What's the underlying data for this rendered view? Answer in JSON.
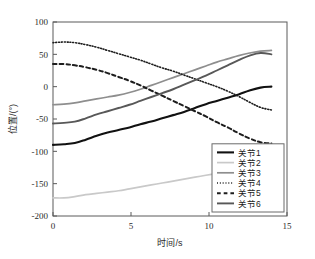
{
  "chart_data": {
    "type": "line",
    "title": "",
    "xlabel": "时间/s",
    "ylabel": "位置/(°)",
    "xlim": [
      0,
      15
    ],
    "ylim": [
      -200,
      100
    ],
    "xticks": [
      "0",
      "5",
      "10",
      "15"
    ],
    "xtick_values": [
      0,
      5,
      10,
      15
    ],
    "yticks": [
      "100",
      "50",
      "0",
      "-50",
      "-100",
      "-150",
      "-200"
    ],
    "ytick_values": [
      100,
      50,
      0,
      -50,
      -100,
      -150,
      -200
    ],
    "grid": false,
    "legend_position": "lower right",
    "x": [
      0,
      0.7,
      1.4,
      2.1,
      2.8,
      3.5,
      4.2,
      4.9,
      5.6,
      6.3,
      7.0,
      7.7,
      8.4,
      9.1,
      9.8,
      10.5,
      11.2,
      11.9,
      12.6,
      13.3,
      14.0
    ],
    "series": [
      {
        "name": "关节1",
        "label": "关节1",
        "style": "solid",
        "color": "#111111",
        "width": 2.1,
        "values": [
          -90,
          -89,
          -87,
          -82,
          -76,
          -71,
          -67,
          -63,
          -58,
          -54,
          -49,
          -44,
          -39,
          -33,
          -27,
          -22,
          -17,
          -12,
          -6,
          -1.5,
          0
        ]
      },
      {
        "name": "关节2",
        "label": "关节2",
        "style": "solid",
        "color": "#c9c9c9",
        "width": 1.7,
        "values": [
          -172,
          -172,
          -170,
          -167,
          -165,
          -163,
          -161,
          -158,
          -155,
          -152,
          -149,
          -146,
          -143,
          -140,
          -137,
          -134,
          -131,
          -129,
          -127,
          -125,
          -125
        ]
      },
      {
        "name": "关节3",
        "label": "关节3",
        "style": "solid",
        "color": "#8e8e8e",
        "width": 1.7,
        "values": [
          -28,
          -27,
          -25,
          -22,
          -19,
          -16,
          -13,
          -9,
          -4,
          2,
          8,
          14,
          20,
          26,
          32,
          38,
          43,
          48,
          52,
          55,
          56
        ]
      },
      {
        "name": "关节4",
        "label": "关节4",
        "style": "dotted",
        "color": "#1d1d1d",
        "width": 1.6,
        "values": [
          68,
          69,
          68,
          65,
          61,
          56,
          51,
          46,
          41,
          35,
          29,
          24,
          18,
          12,
          6,
          0,
          -7,
          -15,
          -24,
          -32,
          -36
        ]
      },
      {
        "name": "关节5",
        "label": "关节5",
        "style": "dashed",
        "color": "#1d1d1d",
        "width": 2.0,
        "values": [
          35,
          35,
          33,
          30,
          26,
          21,
          15,
          9,
          2,
          -6,
          -14,
          -22,
          -30,
          -38,
          -46,
          -55,
          -63,
          -72,
          -80,
          -86,
          -88
        ]
      },
      {
        "name": "关节6",
        "label": "关节6",
        "style": "solid",
        "color": "#585858",
        "width": 1.9,
        "values": [
          -57,
          -56,
          -54,
          -49,
          -43,
          -38,
          -33,
          -28,
          -22,
          -16,
          -10,
          -4,
          3,
          10,
          17,
          25,
          33,
          41,
          48,
          52,
          50
        ]
      }
    ]
  }
}
